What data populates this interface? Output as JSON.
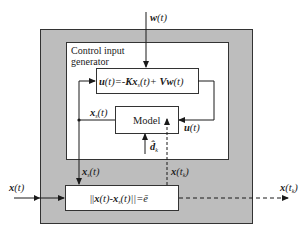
{
  "blocks": {
    "outer_system": {
      "fill": "#bdbdbd",
      "label": ""
    },
    "control_input_generator": {
      "label_line1": "Control input",
      "label_line2": "generator",
      "fill": "#ffffff"
    },
    "control_law": {
      "label": "u(t)=-Kx_s(t)+Vw(t)",
      "parts": [
        "u",
        "(t)=-",
        "K",
        "x",
        "s",
        "(t)+ ",
        "V",
        "w",
        "(t)"
      ]
    },
    "model": {
      "label": "Model"
    },
    "threshold": {
      "label": "||x(t)-x_s(t)||=ē",
      "parts": [
        "||",
        "x",
        "(t)-",
        "x",
        "s",
        "(t)||=",
        "ē"
      ]
    }
  },
  "signals": {
    "w_input": {
      "base": "w",
      "arg": "(t)"
    },
    "x_input": {
      "base": "x",
      "arg": "(t)"
    },
    "x_output": {
      "base": "x",
      "arg": "(t",
      "sub": "k",
      "close": ")"
    },
    "xs_model": {
      "base": "x",
      "sub": "s",
      "arg": "(t)"
    },
    "xs_down": {
      "base": "x",
      "sub": "s",
      "arg": "(t)"
    },
    "u_feedback": {
      "base": "u",
      "arg": "(t)"
    },
    "d_hat": {
      "base": "d̂",
      "sub": "k"
    },
    "x_tk_up": {
      "base": "x",
      "arg": "(t",
      "sub": "k",
      "close": ")"
    }
  },
  "colors": {
    "line": "#1a1a1a",
    "gray": "#bdbdbd",
    "box": "#ffffff"
  }
}
